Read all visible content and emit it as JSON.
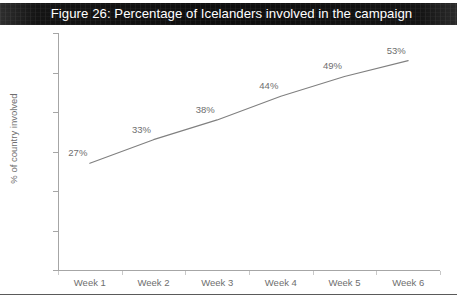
{
  "figure": {
    "title": "Figure 26: Percentage of Icelanders involved in the campaign",
    "title_band_color": "#141414",
    "title_text_color": "#ffffff",
    "line_color": "#808080",
    "axis_color": "#a6a6a6",
    "text_color": "#6e6e6e"
  },
  "chart_data": {
    "type": "line",
    "title": "Figure 26: Percentage of Icelanders involved in the campaign",
    "xlabel": "",
    "ylabel": "% of country involved",
    "categories": [
      "Week 1",
      "Week 2",
      "Week 3",
      "Week 4",
      "Week 5",
      "Week 6"
    ],
    "values": [
      27,
      33,
      38,
      44,
      49,
      53
    ],
    "point_labels": [
      "27%",
      "33%",
      "38%",
      "44%",
      "49%",
      "53%"
    ],
    "ylim": [
      0,
      60
    ],
    "yticks": [
      0,
      10,
      20,
      30,
      40,
      50,
      60
    ],
    "ytick_labels": [
      "0%",
      "10%",
      "20%",
      "30%",
      "40%",
      "50%",
      "60%"
    ],
    "grid": false,
    "legend": "none",
    "series": [
      {
        "name": "% of country involved",
        "values": [
          27,
          33,
          38,
          44,
          49,
          53
        ]
      }
    ]
  }
}
